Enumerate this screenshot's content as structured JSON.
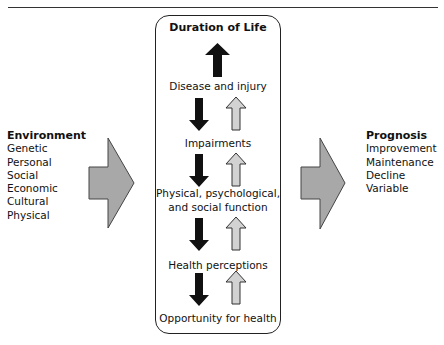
{
  "diagram": {
    "type": "flow-diagram",
    "center_box": {
      "title": "Duration of Life",
      "stages": [
        {
          "line1": "Disease and injury"
        },
        {
          "line1": "Impairments"
        },
        {
          "line1": "Physical, psychological,",
          "line2": "and social function"
        },
        {
          "line1": "Health perceptions"
        },
        {
          "line1": "Opportunity for health"
        }
      ],
      "arrow_pairs": 4,
      "arrow_colors": {
        "down": "#111111",
        "up_fill": "#d2d2d2",
        "up_stroke": "#333333"
      }
    },
    "left": {
      "heading": "Environment",
      "items": [
        "Genetic",
        "Personal",
        "Social",
        "Economic",
        "Cultural",
        "Physical"
      ]
    },
    "right": {
      "heading": "Prognosis",
      "items": [
        "Improvement",
        "Maintenance",
        "Decline",
        "Variable"
      ]
    },
    "block_arrow_color": "#a8a8a8"
  }
}
